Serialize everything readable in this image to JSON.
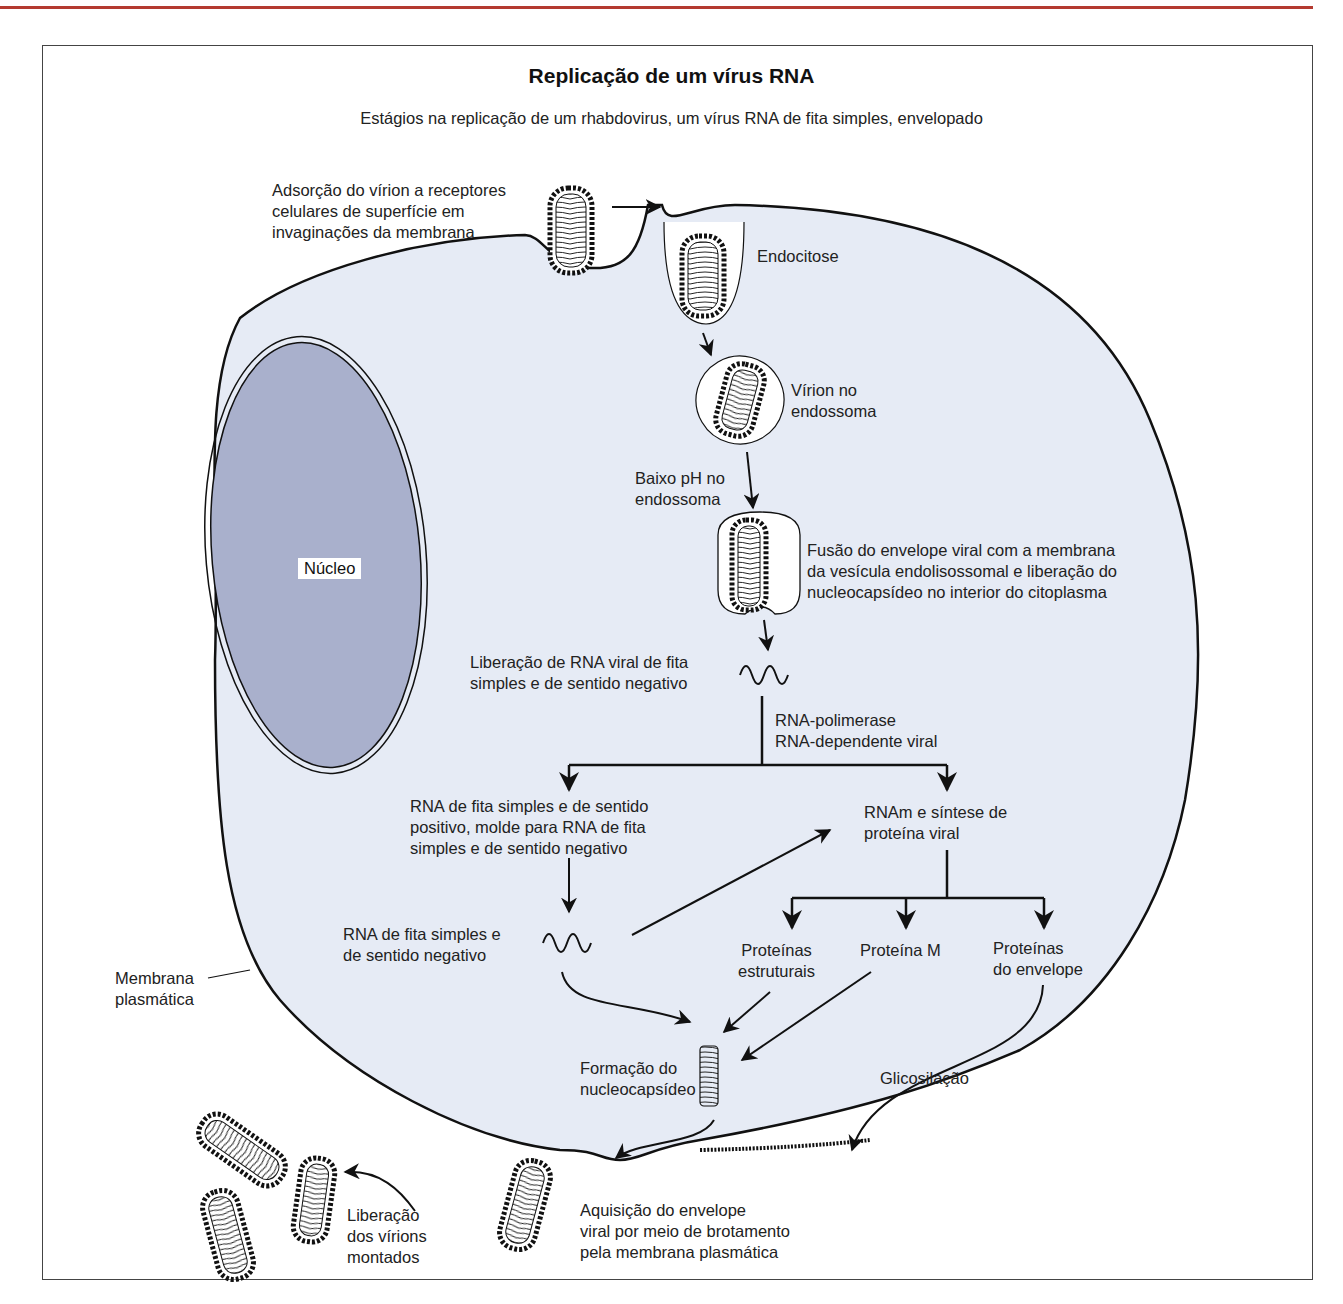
{
  "figure": {
    "title": "Replicação de um vírus RNA",
    "subtitle": "Estágios na replicação de um rhabdovirus, um vírus RNA de fita simples, envelopado"
  },
  "colors": {
    "cytoplasm": "#e6ebf5",
    "nucleus": "#a9b0cc",
    "outline": "#111111",
    "top_rule": "#b43a30"
  },
  "labels": {
    "adsorption": [
      "Adsorção do vírion a receptores",
      "celulares de superfície em",
      "invaginações da membrana"
    ],
    "endocytosis": "Endocitose",
    "virion_endosome": [
      "Vírion no",
      "endossoma"
    ],
    "low_ph": [
      "Baixo pH no",
      "endossoma"
    ],
    "fusion": [
      "Fusão do envelope viral com a membrana",
      "da vesícula endolisossomal e liberação do",
      "nucleocapsídeo no interior do citoplasma"
    ],
    "rna_release": [
      "Liberação de RNA viral de fita",
      "simples e de sentido negativo"
    ],
    "polymerase": [
      "RNA-polimerase",
      "RNA-dependente viral"
    ],
    "positive_rna": [
      "RNA de fita simples e de sentido",
      "positivo, molde para RNA de fita",
      "simples e de  sentido negativo"
    ],
    "mrna": [
      "RNAm e síntese de",
      "proteína viral"
    ],
    "negative_rna": [
      "RNA de fita simples e",
      "de sentido negativo"
    ],
    "structural_proteins": [
      "Proteínas",
      "estruturais"
    ],
    "protein_m": "Proteína M",
    "envelope_proteins": [
      "Proteínas",
      "do envelope"
    ],
    "nucleocapsid_formation": [
      "Formação do",
      "nucleocapsídeo"
    ],
    "glycosylation": "Glicosilação",
    "budding": [
      "Aquisição do envelope",
      "viral por meio de brotamento",
      "pela membrana plasmática"
    ],
    "release": [
      "Liberação",
      "dos vírions",
      "montados"
    ],
    "plasma_membrane": [
      "Membrana",
      "plasmática"
    ],
    "nucleus": "Núcleo"
  }
}
